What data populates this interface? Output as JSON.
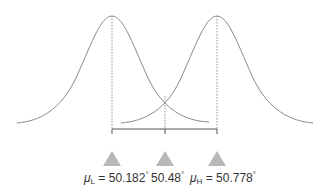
{
  "diagram": {
    "type": "two overlapping normal distributions with threshold",
    "curve_color": "#8a8a8a",
    "marker_color": "#b8b8b8",
    "markers": [
      {
        "id": "mu_l",
        "symbol": "μ",
        "subscript": "L",
        "equals": " = ",
        "value": "50.182",
        "unit": "°"
      },
      {
        "id": "threshold",
        "symbol": "",
        "subscript": "",
        "equals": "",
        "value": "50.48",
        "unit": "°"
      },
      {
        "id": "mu_h",
        "symbol": "μ",
        "subscript": "H",
        "equals": " = ",
        "value": "50.778",
        "unit": "°"
      }
    ]
  }
}
